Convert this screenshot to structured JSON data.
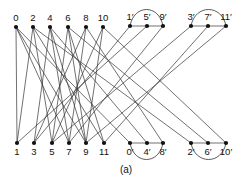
{
  "caption": "(a)",
  "nodes": {
    "top_left": [
      {
        "label": "0",
        "x": 16,
        "y": 27
      },
      {
        "label": "2",
        "x": 33,
        "y": 27
      },
      {
        "label": "4",
        "x": 50,
        "y": 27
      },
      {
        "label": "6",
        "x": 68,
        "y": 27
      },
      {
        "label": "8",
        "x": 86,
        "y": 27
      },
      {
        "label": "10",
        "x": 103,
        "y": 27
      }
    ],
    "top_right": [
      {
        "label": "1′",
        "x": 130,
        "y": 26
      },
      {
        "label": "5′",
        "x": 147,
        "y": 26
      },
      {
        "label": "9′",
        "x": 163,
        "y": 26
      },
      {
        "label": "3′",
        "x": 191,
        "y": 26
      },
      {
        "label": "7′",
        "x": 208,
        "y": 26
      },
      {
        "label": "11′",
        "x": 226,
        "y": 26
      }
    ],
    "bottom_left": [
      {
        "label": "1",
        "x": 17,
        "y": 143
      },
      {
        "label": "3",
        "x": 34,
        "y": 143
      },
      {
        "label": "5",
        "x": 52,
        "y": 143
      },
      {
        "label": "7",
        "x": 69,
        "y": 143
      },
      {
        "label": "9",
        "x": 86,
        "y": 143
      },
      {
        "label": "11",
        "x": 104,
        "y": 143
      }
    ],
    "bottom_right": [
      {
        "label": "0′",
        "x": 130,
        "y": 143
      },
      {
        "label": "4′",
        "x": 147,
        "y": 143
      },
      {
        "label": "8′",
        "x": 163,
        "y": 143
      },
      {
        "label": "2′",
        "x": 191,
        "y": 143
      },
      {
        "label": "6′",
        "x": 208,
        "y": 143
      },
      {
        "label": "10′",
        "x": 226,
        "y": 143
      }
    ]
  }
}
